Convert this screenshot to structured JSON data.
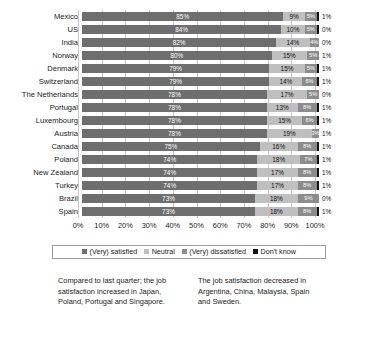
{
  "chart_data": {
    "type": "bar",
    "subtype": "stacked-horizontal-100",
    "title": "",
    "xlabel": "",
    "ylabel": "",
    "xlim": [
      0,
      100
    ],
    "grid": true,
    "legend_position": "bottom",
    "categories": [
      "Mexico",
      "US",
      "India",
      "Norway",
      "Denmark",
      "Switzerland",
      "The Netherlands",
      "Portugal",
      "Luxembourg",
      "Austria",
      "Canada",
      "Poland",
      "New Zealand",
      "Turkey",
      "Brazil",
      "Spain"
    ],
    "series": [
      {
        "name": "(Very) satisfied",
        "color": "#6e6e6e",
        "values": [
          85,
          84,
          82,
          80,
          79,
          79,
          78,
          78,
          78,
          78,
          75,
          74,
          74,
          74,
          73,
          73
        ]
      },
      {
        "name": "Neutral",
        "color": "#bfbfbf",
        "values": [
          9,
          10,
          14,
          15,
          15,
          14,
          17,
          13,
          15,
          19,
          16,
          18,
          17,
          17,
          18,
          18
        ]
      },
      {
        "name": "(Very) dissatisfied",
        "color": "#8c8c8c",
        "values": [
          5,
          5,
          4,
          5,
          5,
          6,
          5,
          8,
          6,
          3,
          8,
          7,
          8,
          8,
          9,
          8
        ]
      },
      {
        "name": "Don't know",
        "color": "#111111",
        "values": [
          1,
          1,
          0,
          0,
          1,
          1,
          0,
          1,
          1,
          0,
          1,
          1,
          1,
          1,
          0,
          1
        ]
      }
    ],
    "dont_know_labels": [
      "1%",
      "0%",
      "0%",
      "1%",
      "1%",
      "1%",
      "0%",
      "1%",
      "1%",
      "1%",
      "1%",
      "1%",
      "1%",
      "1%",
      "0%",
      "1%"
    ],
    "xticks": [
      "0%",
      "10%",
      "20%",
      "30%",
      "40%",
      "50%",
      "60%",
      "70%",
      "80%",
      "90%",
      "100%"
    ],
    "annotations": [
      "Compared to last quarter; the job satisfaction increased in Japan, Poland, Portugal and Singapore.",
      "The job satisfaction decreased in Argentina, China, Malaysia, Spain and Sweden."
    ]
  },
  "legend": {
    "items": [
      {
        "label": "(Very) satisfied"
      },
      {
        "label": "Neutral"
      },
      {
        "label": "(Very) dissatisfied"
      },
      {
        "label": "Don't know"
      }
    ]
  },
  "notes": {
    "left": "Compared to last quarter; the job satisfaction increased in Japan, Poland, Portugal and Singapore.",
    "right": "The job satisfaction decreased in Argentina, China, Malaysia, Spain and Sweden."
  }
}
